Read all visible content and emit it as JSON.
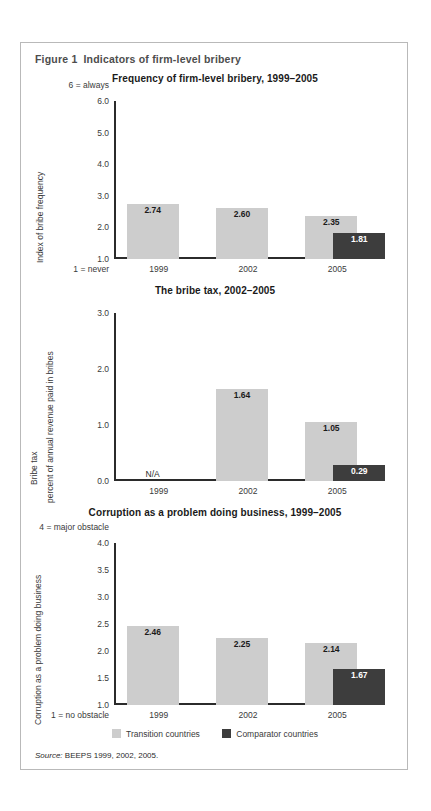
{
  "figure": {
    "number": "Figure 1",
    "title": "Indicators of firm-level bribery",
    "source_label": "Source:",
    "source_text": "BEEPS 1999, 2002, 2005."
  },
  "legend": {
    "transition": "Transition countries",
    "comparator": "Comparator countries",
    "transition_color": "#cdcdcd",
    "comparator_color": "#3d3d3d"
  },
  "chart_data": [
    {
      "type": "bar",
      "id": "bribe-frequency",
      "title": "Frequency of firm-level bribery, 1999–2005",
      "ylabel": "Index of bribe frequency",
      "ylabel2": "",
      "top_caption": "6 = always",
      "bottom_caption": "1 = never",
      "categories": [
        "1999",
        "2002",
        "2005"
      ],
      "yticks": [
        "6.0",
        "5.0",
        "4.0",
        "3.0",
        "2.0",
        "1.0"
      ],
      "ylim": [
        1.0,
        6.0
      ],
      "grid": false,
      "legend_position": "bottom",
      "series": [
        {
          "name": "Transition countries",
          "values": [
            2.74,
            2.6,
            2.35
          ],
          "labels": [
            "2.74",
            "2.60",
            "2.35"
          ]
        },
        {
          "name": "Comparator countries",
          "values": [
            null,
            null,
            1.81
          ],
          "labels": [
            "",
            "",
            "1.81"
          ]
        }
      ]
    },
    {
      "type": "bar",
      "id": "bribe-tax",
      "title": "The bribe tax, 2002–2005",
      "ylabel": "Bribe tax",
      "ylabel2": "percent of annual revenue paid in bribes",
      "top_caption": "",
      "bottom_caption": "",
      "categories": [
        "1999",
        "2002",
        "2005"
      ],
      "yticks": [
        "3.0",
        "2.0",
        "1.0",
        "0.0"
      ],
      "ylim": [
        0.0,
        3.0
      ],
      "grid": false,
      "legend_position": "bottom",
      "na_label": "N/A",
      "series": [
        {
          "name": "Transition countries",
          "values": [
            null,
            1.64,
            1.05
          ],
          "labels": [
            "",
            "1.64",
            "1.05"
          ]
        },
        {
          "name": "Comparator countries",
          "values": [
            null,
            null,
            0.29
          ],
          "labels": [
            "",
            "",
            "0.29"
          ]
        }
      ]
    },
    {
      "type": "bar",
      "id": "corruption-problem",
      "title": "Corruption as a problem doing business, 1999–2005",
      "ylabel": "Corruption as a problem doing business",
      "ylabel2": "",
      "top_caption": "4 = major obstacle",
      "bottom_caption": "1 = no obstacle",
      "categories": [
        "1999",
        "2002",
        "2005"
      ],
      "yticks": [
        "4.0",
        "3.5",
        "3.0",
        "2.5",
        "2.0",
        "1.5",
        "1.0"
      ],
      "ylim": [
        1.0,
        4.0
      ],
      "grid": false,
      "legend_position": "bottom",
      "series": [
        {
          "name": "Transition countries",
          "values": [
            2.46,
            2.25,
            2.14
          ],
          "labels": [
            "2.46",
            "2.25",
            "2.14"
          ]
        },
        {
          "name": "Comparator countries",
          "values": [
            null,
            null,
            1.67
          ],
          "labels": [
            "",
            "",
            "1.67"
          ]
        }
      ]
    }
  ]
}
